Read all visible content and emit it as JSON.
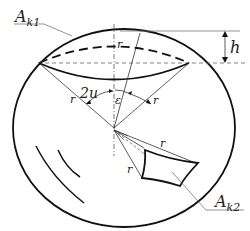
{
  "diagram": {
    "type": "geometry-sphere-segments",
    "labels": {
      "cap_area": "A",
      "cap_area_sub": "k1",
      "patch_area": "A",
      "patch_area_sub": "k2",
      "height": "h",
      "radius": "r",
      "cone_angle": "2u",
      "offset_angle": "ε"
    },
    "colors": {
      "stroke": "#111111",
      "thin": "#333333",
      "dashed": "#555555",
      "background": "#ffffff"
    }
  }
}
